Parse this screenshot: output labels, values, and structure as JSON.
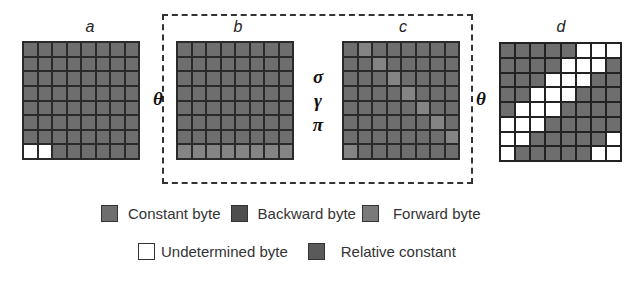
{
  "figure": {
    "grids": [
      {
        "label": "a",
        "cells": [
          [
            0,
            0,
            0,
            0,
            0,
            0,
            0,
            0
          ],
          [
            0,
            0,
            0,
            0,
            0,
            0,
            0,
            0
          ],
          [
            0,
            0,
            0,
            0,
            0,
            0,
            0,
            0
          ],
          [
            0,
            0,
            0,
            0,
            0,
            0,
            0,
            0
          ],
          [
            0,
            0,
            0,
            0,
            0,
            0,
            0,
            0
          ],
          [
            0,
            0,
            0,
            0,
            0,
            0,
            0,
            0
          ],
          [
            0,
            0,
            0,
            0,
            0,
            0,
            0,
            0
          ],
          [
            1,
            1,
            0,
            0,
            0,
            0,
            0,
            0
          ]
        ]
      },
      {
        "label": "b",
        "cells": [
          [
            0,
            0,
            0,
            0,
            0,
            0,
            0,
            0
          ],
          [
            0,
            0,
            0,
            0,
            0,
            0,
            0,
            0
          ],
          [
            0,
            0,
            0,
            0,
            0,
            0,
            0,
            0
          ],
          [
            0,
            0,
            0,
            0,
            0,
            0,
            0,
            0
          ],
          [
            0,
            0,
            0,
            0,
            0,
            0,
            0,
            0
          ],
          [
            0,
            0,
            0,
            0,
            0,
            0,
            0,
            0
          ],
          [
            0,
            0,
            0,
            0,
            0,
            0,
            0,
            0
          ],
          [
            2,
            2,
            2,
            2,
            2,
            2,
            2,
            2
          ]
        ]
      },
      {
        "label": "c",
        "cells": [
          [
            0,
            2,
            0,
            0,
            0,
            0,
            0,
            0
          ],
          [
            0,
            0,
            2,
            0,
            0,
            0,
            0,
            0
          ],
          [
            0,
            0,
            0,
            2,
            0,
            0,
            0,
            0
          ],
          [
            0,
            0,
            0,
            0,
            2,
            0,
            0,
            0
          ],
          [
            0,
            0,
            0,
            0,
            0,
            2,
            0,
            0
          ],
          [
            0,
            0,
            0,
            0,
            0,
            0,
            2,
            0
          ],
          [
            0,
            0,
            0,
            0,
            0,
            0,
            0,
            2
          ],
          [
            2,
            0,
            0,
            0,
            0,
            0,
            0,
            0
          ]
        ]
      },
      {
        "label": "d",
        "cells": [
          [
            0,
            0,
            0,
            0,
            0,
            1,
            1,
            1
          ],
          [
            0,
            0,
            0,
            0,
            1,
            1,
            1,
            0
          ],
          [
            0,
            0,
            0,
            1,
            1,
            1,
            0,
            0
          ],
          [
            0,
            0,
            1,
            1,
            1,
            0,
            0,
            0
          ],
          [
            0,
            1,
            1,
            1,
            0,
            0,
            0,
            0
          ],
          [
            1,
            1,
            1,
            0,
            0,
            0,
            0,
            0
          ],
          [
            1,
            1,
            0,
            0,
            0,
            0,
            0,
            1
          ],
          [
            1,
            0,
            0,
            0,
            0,
            0,
            1,
            1
          ]
        ]
      }
    ],
    "symbols": {
      "theta_left": "θ",
      "theta_right": "θ",
      "sigma": "σ",
      "gamma": "γ",
      "pi": "π"
    },
    "legend": {
      "row1": [
        {
          "label": "Constant byte",
          "color": "#6e6e6e"
        },
        {
          "label": "Backward byte",
          "color": "#4e4e4e"
        },
        {
          "label": "Forward byte",
          "color": "#7a7a7a"
        }
      ],
      "row2": [
        {
          "label": "Undetermined byte",
          "color": "#ffffff"
        },
        {
          "label": "Relative constant",
          "color": "#5a5a5a"
        }
      ]
    }
  }
}
